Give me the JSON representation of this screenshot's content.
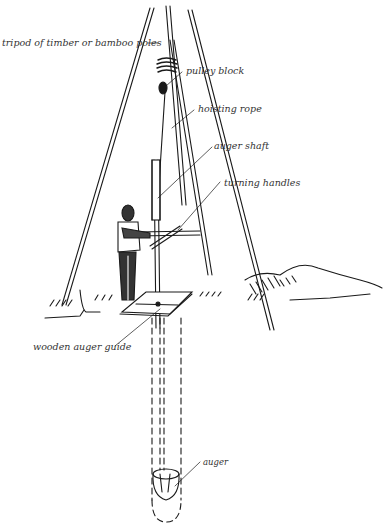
{
  "figure": {
    "type": "illustration",
    "ink_color": "#1a1a1a",
    "background_color": "#ffffff"
  },
  "labels": {
    "tripod": "tripod of timber or bamboo poles",
    "pulley": "pulley block",
    "rope": "hoisting rope",
    "shaft": "auger shaft",
    "handles": "turning handles",
    "guide": "wooden auger guide",
    "auger": "auger"
  }
}
